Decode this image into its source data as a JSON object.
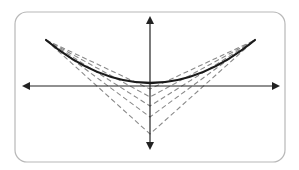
{
  "diagram": {
    "title": "",
    "frame": {
      "x": 15,
      "y": 12,
      "width": 270,
      "height": 150,
      "radius": 12,
      "stroke": "#b8b8b8"
    },
    "axes": {
      "color": "#222222",
      "origin": {
        "x": 150,
        "y": 86
      },
      "x_axis": {
        "x1": 20,
        "x2": 282,
        "y": 86
      },
      "y_axis": {
        "x": 150,
        "y1": 14,
        "y2": 152
      }
    },
    "curve": {
      "type": "solid",
      "color": "#1a1a1a",
      "left_end": {
        "x": 46,
        "y": 40
      },
      "vertex": {
        "x": 150,
        "y": 86
      },
      "right_end": {
        "x": 255,
        "y": 40
      }
    },
    "dashed_lines": {
      "color": "#8a8a8a",
      "dasharray": "5,3",
      "left_anchor": {
        "x": 46,
        "y": 40
      },
      "right_anchor": {
        "x": 255,
        "y": 40
      },
      "vertices_y": [
        89,
        97,
        106,
        117,
        134
      ]
    }
  }
}
